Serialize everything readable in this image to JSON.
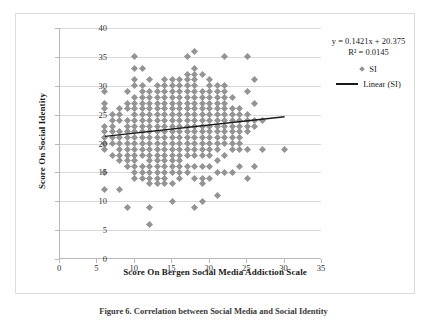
{
  "figure": {
    "caption": "Figure 6. Correlation between Social Media and Social Identity"
  },
  "chart_data": {
    "type": "scatter",
    "title": "",
    "xlabel": "Score On Bergen Social Media Addiction Scale",
    "ylabel": "Score On Social Identity",
    "xlim": [
      0,
      35
    ],
    "ylim": [
      0,
      40
    ],
    "xticks": [
      0,
      5,
      10,
      15,
      20,
      25,
      30,
      35
    ],
    "yticks": [
      0,
      5,
      10,
      15,
      20,
      25,
      30,
      35,
      40
    ],
    "grid": "horizontal",
    "legend_position": "right-outside",
    "marker_color": "#949494",
    "trendline_color": "#1a1a1a",
    "annotations": {
      "equation": "y = 0.1421x + 20.375",
      "r_squared": "R² = 0.0145"
    },
    "series": [
      {
        "name": "SI",
        "marker": "diamond",
        "points": [
          [
            6,
            29
          ],
          [
            6,
            27
          ],
          [
            6,
            26
          ],
          [
            6,
            23
          ],
          [
            6,
            22
          ],
          [
            6,
            21
          ],
          [
            6,
            20
          ],
          [
            6,
            19
          ],
          [
            6,
            15
          ],
          [
            6,
            12
          ],
          [
            7,
            25
          ],
          [
            7,
            24
          ],
          [
            7,
            23
          ],
          [
            7,
            22
          ],
          [
            7,
            21
          ],
          [
            7,
            20
          ],
          [
            7,
            18
          ],
          [
            8,
            26
          ],
          [
            8,
            25
          ],
          [
            8,
            24
          ],
          [
            8,
            22
          ],
          [
            8,
            21
          ],
          [
            8,
            20
          ],
          [
            8,
            19
          ],
          [
            8,
            18
          ],
          [
            8,
            17
          ],
          [
            8,
            12
          ],
          [
            9,
            29
          ],
          [
            9,
            27
          ],
          [
            9,
            26
          ],
          [
            9,
            24
          ],
          [
            9,
            23
          ],
          [
            9,
            22
          ],
          [
            9,
            21
          ],
          [
            9,
            20
          ],
          [
            9,
            19
          ],
          [
            9,
            18
          ],
          [
            9,
            17
          ],
          [
            9,
            16
          ],
          [
            9,
            9
          ],
          [
            10,
            35
          ],
          [
            10,
            33
          ],
          [
            10,
            31
          ],
          [
            10,
            30
          ],
          [
            10,
            28
          ],
          [
            10,
            27
          ],
          [
            10,
            26
          ],
          [
            10,
            25
          ],
          [
            10,
            24
          ],
          [
            10,
            23
          ],
          [
            10,
            22
          ],
          [
            10,
            21
          ],
          [
            10,
            20
          ],
          [
            10,
            19
          ],
          [
            10,
            18
          ],
          [
            10,
            17
          ],
          [
            10,
            16
          ],
          [
            10,
            15
          ],
          [
            10,
            14
          ],
          [
            11,
            33
          ],
          [
            11,
            30
          ],
          [
            11,
            29
          ],
          [
            11,
            28
          ],
          [
            11,
            27
          ],
          [
            11,
            26
          ],
          [
            11,
            25
          ],
          [
            11,
            24
          ],
          [
            11,
            23
          ],
          [
            11,
            22
          ],
          [
            11,
            21
          ],
          [
            11,
            20
          ],
          [
            11,
            19
          ],
          [
            11,
            18
          ],
          [
            11,
            16
          ],
          [
            11,
            15
          ],
          [
            11,
            14
          ],
          [
            12,
            31
          ],
          [
            12,
            29
          ],
          [
            12,
            28
          ],
          [
            12,
            27
          ],
          [
            12,
            26
          ],
          [
            12,
            25
          ],
          [
            12,
            24
          ],
          [
            12,
            23
          ],
          [
            12,
            22
          ],
          [
            12,
            21
          ],
          [
            12,
            20
          ],
          [
            12,
            19
          ],
          [
            12,
            18
          ],
          [
            12,
            17
          ],
          [
            12,
            16
          ],
          [
            12,
            15
          ],
          [
            12,
            14
          ],
          [
            12,
            13
          ],
          [
            12,
            9
          ],
          [
            12,
            6
          ],
          [
            13,
            30
          ],
          [
            13,
            29
          ],
          [
            13,
            28
          ],
          [
            13,
            27
          ],
          [
            13,
            26
          ],
          [
            13,
            25
          ],
          [
            13,
            24
          ],
          [
            13,
            23
          ],
          [
            13,
            22
          ],
          [
            13,
            21
          ],
          [
            13,
            20
          ],
          [
            13,
            19
          ],
          [
            13,
            18
          ],
          [
            13,
            17
          ],
          [
            13,
            16
          ],
          [
            13,
            15
          ],
          [
            13,
            14
          ],
          [
            13,
            13
          ],
          [
            14,
            31
          ],
          [
            14,
            30
          ],
          [
            14,
            29
          ],
          [
            14,
            28
          ],
          [
            14,
            27
          ],
          [
            14,
            26
          ],
          [
            14,
            25
          ],
          [
            14,
            24
          ],
          [
            14,
            23
          ],
          [
            14,
            22
          ],
          [
            14,
            21
          ],
          [
            14,
            20
          ],
          [
            14,
            19
          ],
          [
            14,
            18
          ],
          [
            14,
            17
          ],
          [
            14,
            16
          ],
          [
            14,
            15
          ],
          [
            14,
            14
          ],
          [
            14,
            13
          ],
          [
            15,
            31
          ],
          [
            15,
            30
          ],
          [
            15,
            29
          ],
          [
            15,
            28
          ],
          [
            15,
            27
          ],
          [
            15,
            26
          ],
          [
            15,
            25
          ],
          [
            15,
            24
          ],
          [
            15,
            23
          ],
          [
            15,
            22
          ],
          [
            15,
            21
          ],
          [
            15,
            20
          ],
          [
            15,
            19
          ],
          [
            15,
            18
          ],
          [
            15,
            17
          ],
          [
            15,
            16
          ],
          [
            15,
            15
          ],
          [
            15,
            13
          ],
          [
            15,
            10
          ],
          [
            16,
            31
          ],
          [
            16,
            30
          ],
          [
            16,
            29
          ],
          [
            16,
            28
          ],
          [
            16,
            27
          ],
          [
            16,
            26
          ],
          [
            16,
            25
          ],
          [
            16,
            24
          ],
          [
            16,
            23
          ],
          [
            16,
            22
          ],
          [
            16,
            21
          ],
          [
            16,
            20
          ],
          [
            16,
            19
          ],
          [
            16,
            18
          ],
          [
            16,
            17
          ],
          [
            16,
            16
          ],
          [
            16,
            15
          ],
          [
            16,
            14
          ],
          [
            17,
            35
          ],
          [
            17,
            32
          ],
          [
            17,
            31
          ],
          [
            17,
            30
          ],
          [
            17,
            29
          ],
          [
            17,
            28
          ],
          [
            17,
            27
          ],
          [
            17,
            26
          ],
          [
            17,
            25
          ],
          [
            17,
            24
          ],
          [
            17,
            23
          ],
          [
            17,
            22
          ],
          [
            17,
            21
          ],
          [
            17,
            20
          ],
          [
            17,
            19
          ],
          [
            17,
            18
          ],
          [
            17,
            16
          ],
          [
            17,
            15
          ],
          [
            18,
            36
          ],
          [
            18,
            33
          ],
          [
            18,
            32
          ],
          [
            18,
            31
          ],
          [
            18,
            30
          ],
          [
            18,
            29
          ],
          [
            18,
            28
          ],
          [
            18,
            27
          ],
          [
            18,
            26
          ],
          [
            18,
            25
          ],
          [
            18,
            24
          ],
          [
            18,
            23
          ],
          [
            18,
            22
          ],
          [
            18,
            21
          ],
          [
            18,
            20
          ],
          [
            18,
            19
          ],
          [
            18,
            18
          ],
          [
            18,
            16
          ],
          [
            18,
            14
          ],
          [
            18,
            9
          ],
          [
            19,
            32
          ],
          [
            19,
            29
          ],
          [
            19,
            28
          ],
          [
            19,
            27
          ],
          [
            19,
            26
          ],
          [
            19,
            25
          ],
          [
            19,
            24
          ],
          [
            19,
            23
          ],
          [
            19,
            22
          ],
          [
            19,
            21
          ],
          [
            19,
            20
          ],
          [
            19,
            19
          ],
          [
            19,
            18
          ],
          [
            19,
            16
          ],
          [
            19,
            14
          ],
          [
            19,
            13
          ],
          [
            19,
            10
          ],
          [
            20,
            31
          ],
          [
            20,
            30
          ],
          [
            20,
            29
          ],
          [
            20,
            28
          ],
          [
            20,
            27
          ],
          [
            20,
            26
          ],
          [
            20,
            25
          ],
          [
            20,
            24
          ],
          [
            20,
            23
          ],
          [
            20,
            22
          ],
          [
            20,
            21
          ],
          [
            20,
            20
          ],
          [
            20,
            19
          ],
          [
            20,
            18
          ],
          [
            20,
            16
          ],
          [
            20,
            14
          ],
          [
            21,
            30
          ],
          [
            21,
            29
          ],
          [
            21,
            28
          ],
          [
            21,
            27
          ],
          [
            21,
            26
          ],
          [
            21,
            25
          ],
          [
            21,
            24
          ],
          [
            21,
            23
          ],
          [
            21,
            22
          ],
          [
            21,
            21
          ],
          [
            21,
            20
          ],
          [
            21,
            19
          ],
          [
            21,
            17
          ],
          [
            21,
            15
          ],
          [
            21,
            11
          ],
          [
            22,
            35
          ],
          [
            22,
            30
          ],
          [
            22,
            29
          ],
          [
            22,
            28
          ],
          [
            22,
            27
          ],
          [
            22,
            26
          ],
          [
            22,
            25
          ],
          [
            22,
            24
          ],
          [
            22,
            23
          ],
          [
            22,
            22
          ],
          [
            22,
            21
          ],
          [
            22,
            20
          ],
          [
            22,
            18
          ],
          [
            22,
            15
          ],
          [
            23,
            28
          ],
          [
            23,
            26
          ],
          [
            23,
            25
          ],
          [
            23,
            24
          ],
          [
            23,
            23
          ],
          [
            23,
            22
          ],
          [
            23,
            21
          ],
          [
            23,
            20
          ],
          [
            23,
            19
          ],
          [
            23,
            15
          ],
          [
            24,
            26
          ],
          [
            24,
            25
          ],
          [
            24,
            24
          ],
          [
            24,
            23
          ],
          [
            24,
            22
          ],
          [
            24,
            21
          ],
          [
            24,
            20
          ],
          [
            24,
            19
          ],
          [
            24,
            16
          ],
          [
            25,
            35
          ],
          [
            25,
            29
          ],
          [
            25,
            25
          ],
          [
            25,
            24
          ],
          [
            25,
            23
          ],
          [
            25,
            22
          ],
          [
            25,
            19
          ],
          [
            25,
            14
          ],
          [
            26,
            31
          ],
          [
            26,
            27
          ],
          [
            26,
            24
          ],
          [
            26,
            23
          ],
          [
            26,
            16
          ],
          [
            27,
            24
          ],
          [
            27,
            19
          ],
          [
            30,
            19
          ]
        ]
      }
    ],
    "trendline": {
      "name": "Linear (SI)",
      "slope": 0.1421,
      "intercept": 20.375,
      "x_start": 6,
      "x_end": 30
    }
  },
  "legend": {
    "equation": "y = 0.1421x + 20.375",
    "r_squared": "R² = 0.0145",
    "series_label": "SI",
    "trend_label": "Linear (SI)"
  }
}
